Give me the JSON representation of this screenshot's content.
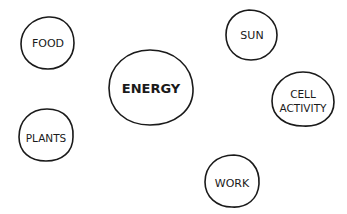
{
  "diagram": {
    "title": "",
    "stroke_color": "#1a1a1a",
    "background": "#ffffff",
    "nodes": [
      {
        "id": "food",
        "lines": [
          "FOOD"
        ]
      },
      {
        "id": "sun",
        "lines": [
          "SUN"
        ]
      },
      {
        "id": "energy",
        "lines": [
          "ENERGY"
        ]
      },
      {
        "id": "cell-activity",
        "lines": [
          "CELL",
          "ACTIVITY"
        ]
      },
      {
        "id": "plants",
        "lines": [
          "PLANTS"
        ]
      },
      {
        "id": "work",
        "lines": [
          "WORK"
        ]
      }
    ]
  }
}
